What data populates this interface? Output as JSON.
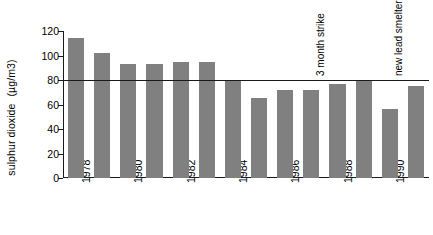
{
  "chart_data": {
    "type": "bar",
    "title": "",
    "xlabel": "",
    "ylabel": "sulphur dioxide",
    "yunit": "(µg/m3)",
    "ylim": [
      0,
      120
    ],
    "yticks": [
      0,
      20,
      40,
      60,
      80,
      100,
      120
    ],
    "grid": false,
    "legend": null,
    "categories": [
      "1978",
      "1979",
      "1980",
      "1981",
      "1982",
      "1983",
      "1984",
      "1985",
      "1986",
      "1987",
      "1988",
      "1989",
      "1990",
      "1991"
    ],
    "tick_labels": [
      "1978",
      "",
      "1980",
      "",
      "1982",
      "",
      "1984",
      "",
      "1986",
      "",
      "1988",
      "",
      "1990",
      ""
    ],
    "values": [
      114,
      102,
      93,
      93,
      95,
      95,
      80,
      65,
      72,
      72,
      77,
      79,
      56,
      75
    ],
    "bar_color": "#808080",
    "reference_line": {
      "value": 80,
      "color": "#1a1a1a"
    },
    "annotations": [
      {
        "text": "3 month strike",
        "category_index": 9
      },
      {
        "text": "new lead smelter trials",
        "category_index": 12
      }
    ]
  }
}
